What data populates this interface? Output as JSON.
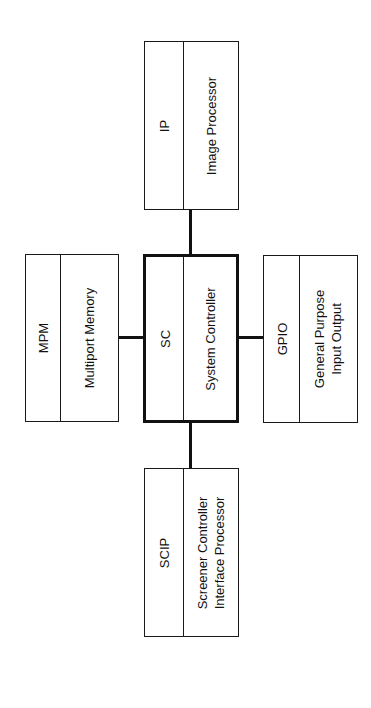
{
  "diagram": {
    "orientation": "rotated-90-ccw",
    "blocks": {
      "ip": {
        "abbr": "IP",
        "lines": [
          "Image Processor"
        ]
      },
      "mpm": {
        "abbr": "MPM",
        "lines": [
          "Multiport Memory"
        ]
      },
      "sc": {
        "abbr": "SC",
        "lines": [
          "System Controller"
        ]
      },
      "gpio": {
        "abbr": "GPIO",
        "lines": [
          "General Purpose",
          "Input Output"
        ]
      },
      "scip": {
        "abbr": "SCIP",
        "lines": [
          "Screener Controller",
          "Interface Processor"
        ]
      }
    },
    "connections": [
      {
        "from": "SC",
        "to": "IP"
      },
      {
        "from": "SC",
        "to": "MPM"
      },
      {
        "from": "SC",
        "to": "GPIO"
      },
      {
        "from": "SC",
        "to": "SCIP"
      }
    ],
    "colors": {
      "line": "#111111",
      "background": "#ffffff"
    }
  }
}
